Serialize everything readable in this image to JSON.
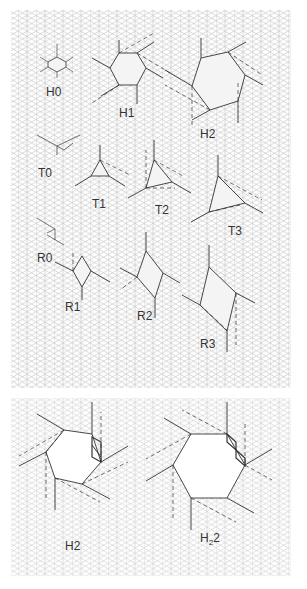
{
  "figure": {
    "top_panel": {
      "labels": {
        "H0": "H0",
        "H1": "H1",
        "H2": "H2",
        "T0": "T0",
        "T1": "T1",
        "T2": "T2",
        "T3": "T3",
        "R0": "R0",
        "R1": "R1",
        "R2": "R2",
        "R3": "R3"
      },
      "rows": [
        {
          "name": "hexagons",
          "items": [
            "H0",
            "H1",
            "H2"
          ]
        },
        {
          "name": "triangles",
          "items": [
            "T0",
            "T1",
            "T2",
            "T3"
          ]
        },
        {
          "name": "rhombi",
          "items": [
            "R0",
            "R1",
            "R2",
            "R3"
          ]
        }
      ]
    },
    "bottom_panel": {
      "labels": {
        "left": "H2",
        "right_main": "H",
        "right_sub": "2",
        "right_suffix": "2"
      }
    },
    "colors": {
      "grid": "#c8c8c8",
      "shape": "#333333",
      "dashed": "#555555",
      "fill": "#f4f4f4"
    }
  }
}
